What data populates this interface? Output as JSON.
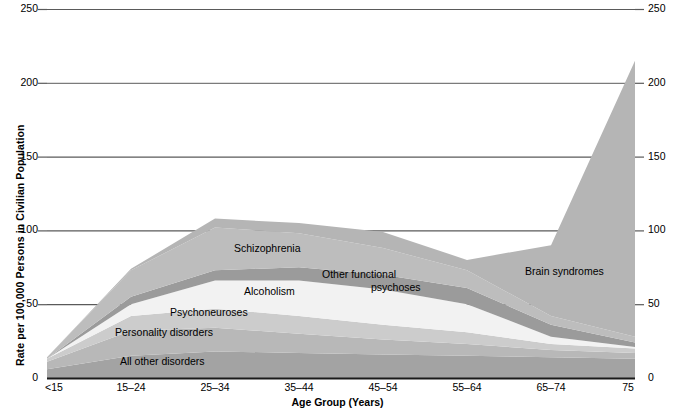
{
  "chart_data": {
    "type": "area",
    "stacked": true,
    "title": "",
    "xlabel": "Age Group (Years)",
    "ylabel": "Rate per 100,000 Persons in Civilian Population",
    "categories": [
      "<15",
      "15–24",
      "25–34",
      "35–44",
      "45–54",
      "55–64",
      "65–74",
      "75"
    ],
    "ylim": [
      0,
      250
    ],
    "yticks": [
      0,
      50,
      100,
      150,
      200,
      250
    ],
    "ytick_labels": [
      "0",
      "50",
      "100",
      "150",
      "200",
      "250"
    ],
    "grid": "horizontal",
    "legend": "inline-labels",
    "series": [
      {
        "name": "All other disorders",
        "color": "#a3a3a3",
        "values": [
          6,
          15,
          18,
          17,
          16,
          15,
          14,
          13
        ]
      },
      {
        "name": "Personality disorders",
        "color": "#b8b8b8",
        "values": [
          5,
          17,
          16,
          13,
          10,
          8,
          5,
          4
        ]
      },
      {
        "name": "Psychoneuroses",
        "color": "#cccccc",
        "values": [
          2,
          10,
          13,
          12,
          10,
          8,
          4,
          3
        ]
      },
      {
        "name": "Alcoholism",
        "color": "#f2f2f2",
        "values": [
          0,
          8,
          19,
          24,
          24,
          19,
          5,
          1
        ]
      },
      {
        "name": "Other functional psychoses",
        "color": "#9b9b9b",
        "values": [
          0,
          5,
          7,
          9,
          10,
          11,
          8,
          3
        ]
      },
      {
        "name": "Schizophrenia",
        "color": "#bdbdbd",
        "values": [
          1,
          18,
          29,
          23,
          18,
          12,
          6,
          4
        ]
      },
      {
        "name": "Brain syndromes",
        "color": "#b5b5b5",
        "values": [
          0,
          1,
          6,
          7,
          11,
          7,
          48,
          187
        ]
      }
    ],
    "totals": [
      14,
      74,
      108,
      105,
      99,
      80,
      90,
      215
    ],
    "annotations": [
      {
        "text": "Schizophrenia",
        "x_px": 234,
        "y_px": 242
      },
      {
        "text": "Other functional",
        "x_px": 322,
        "y_px": 270
      },
      {
        "text": "psychoses",
        "x_px": 371,
        "y_px": 283
      },
      {
        "text": "Alcoholism",
        "x_px": 244,
        "y_px": 287
      },
      {
        "text": "Psychoneuroses",
        "x_px": 170,
        "y_px": 309
      },
      {
        "text": "Personality disorders",
        "x_px": 115,
        "y_px": 329
      },
      {
        "text": "All other disorders",
        "x_px": 120,
        "y_px": 358
      },
      {
        "text": "Brain syndromes",
        "x_px": 525,
        "y_px": 268
      }
    ]
  },
  "axis": {
    "y_title": "Rate per 100,000 Persons in Civilian Population",
    "x_title": "Age Group (Years)",
    "y_ticks": [
      "250",
      "200",
      "150",
      "100",
      "50",
      "0"
    ],
    "x_ticks": [
      "<15",
      "15–24",
      "25–34",
      "35–44",
      "45–54",
      "55–64",
      "65–74",
      "75"
    ]
  },
  "labels": {
    "schizophrenia": "Schizophrenia",
    "other_functional": "Other functional",
    "psychoses": "psychoses",
    "alcoholism": "Alcoholism",
    "psychoneuroses": "Psychoneuroses",
    "personality_disorders": "Personality disorders",
    "all_other_disorders": "All other disorders",
    "brain_syndromes": "Brain syndromes"
  },
  "colors": {
    "axis_line": "#1a1a1a",
    "grid_line": "#5a5a5a",
    "text": "#000000",
    "background": "#ffffff"
  }
}
